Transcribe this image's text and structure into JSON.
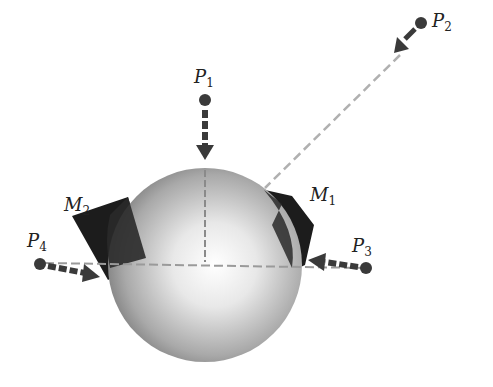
{
  "diagram": {
    "colors": {
      "sphere_light": "#ffffff",
      "sphere_dark": "#6e6e6e",
      "patch": "#1c1c1c",
      "arrow": "#3a3a3a",
      "dashed_line": "#b0b0b0",
      "point": "#3a3a3a"
    },
    "sphere": {
      "cx": 205,
      "cy": 265,
      "r": 97
    },
    "points": [
      {
        "id": "P1",
        "letter": "P",
        "sub": "1",
        "x": 205,
        "y": 100
      },
      {
        "id": "P2",
        "letter": "P",
        "sub": "2",
        "x": 421,
        "y": 23
      },
      {
        "id": "P3",
        "letter": "P",
        "sub": "3",
        "x": 366,
        "y": 268
      },
      {
        "id": "P4",
        "letter": "P",
        "sub": "4",
        "x": 40,
        "y": 264
      }
    ],
    "patches": [
      {
        "id": "M1",
        "letter": "M",
        "sub": "1"
      },
      {
        "id": "M2",
        "letter": "M",
        "sub": "2"
      }
    ]
  }
}
